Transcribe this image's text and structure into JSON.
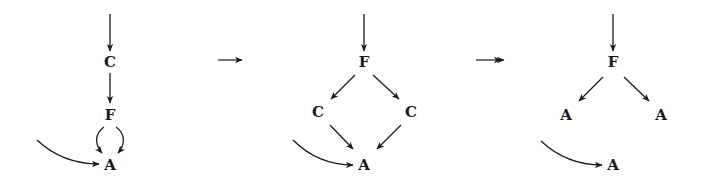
{
  "diagrams": [
    {
      "id": "graph-1",
      "nodes": [
        {
          "id": "C",
          "label": "C",
          "x": 110,
          "y": 67
        },
        {
          "id": "F",
          "label": "F",
          "x": 110,
          "y": 120
        },
        {
          "id": "A",
          "label": "A",
          "x": 110,
          "y": 170
        }
      ]
    },
    {
      "id": "graph-2",
      "nodes": [
        {
          "id": "F",
          "label": "F",
          "x": 364,
          "y": 67
        },
        {
          "id": "C1",
          "label": "C",
          "x": 318,
          "y": 117
        },
        {
          "id": "C2",
          "label": "C",
          "x": 411,
          "y": 117
        },
        {
          "id": "A",
          "label": "A",
          "x": 364,
          "y": 170
        }
      ]
    },
    {
      "id": "graph-3",
      "nodes": [
        {
          "id": "F",
          "label": "F",
          "x": 613,
          "y": 67
        },
        {
          "id": "A1",
          "label": "A",
          "x": 566,
          "y": 120
        },
        {
          "id": "A2",
          "label": "A",
          "x": 661,
          "y": 120
        },
        {
          "id": "A3",
          "label": "A",
          "x": 613,
          "y": 170
        }
      ]
    }
  ],
  "transitions": [
    {
      "id": "step",
      "symbol": "→",
      "meaning": "single step"
    },
    {
      "id": "multi-step",
      "symbol": "↠",
      "meaning": "multi-step reduction"
    }
  ]
}
